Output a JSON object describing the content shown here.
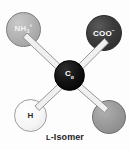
{
  "figure": {
    "caption_prefix": "L",
    "caption_rest": "-Isomer",
    "background_color": "#fdfdfd"
  },
  "molecule": {
    "name": "L-Isomer amino acid",
    "center": {
      "name": "alpha-carbon",
      "label_main": "C",
      "label_sub": "α",
      "color": "#000000",
      "text_color": "#ffffff"
    },
    "substituents": [
      {
        "name": "amino-group",
        "label_main": "NH",
        "label_sub": "3",
        "label_sup": "+",
        "color": "#b4b4b4",
        "text_color": "#f2f2f2",
        "position": "top-left"
      },
      {
        "name": "carboxyl-group",
        "label_main": "COO",
        "label_sup": "−",
        "color": "#3b3b3b",
        "text_color": "#ffffff",
        "position": "top-right"
      },
      {
        "name": "hydrogen",
        "label_main": "H",
        "color": "#f6f6f6",
        "text_color": "#2a2a2a",
        "position": "bottom-left"
      },
      {
        "name": "side-chain-group",
        "label_main": "",
        "color": "#9b9b9b",
        "text_color": "#2a2a2a",
        "position": "bottom-right"
      }
    ],
    "bond_style": {
      "name": "outlined-stick",
      "fill": "#f0f0f0",
      "stroke": "#8a8a8a"
    }
  }
}
